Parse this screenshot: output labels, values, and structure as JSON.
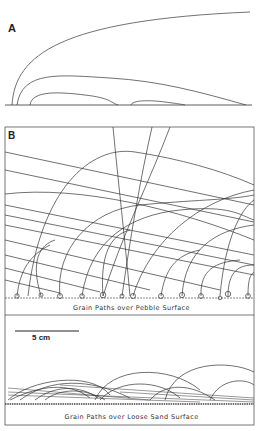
{
  "panels": {
    "a": {
      "label": "A"
    },
    "b": {
      "label": "B"
    }
  },
  "captions": {
    "pebble": "Grain Paths over Pebble Surface",
    "sand": "Grain Paths over Loose Sand Surface"
  },
  "scale_bar": {
    "label": "5 cm"
  },
  "colors": {
    "line": "#333333",
    "frame": "#555555",
    "background": "#ffffff"
  }
}
